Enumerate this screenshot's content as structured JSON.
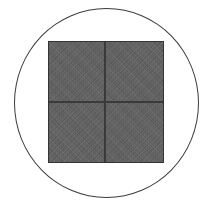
{
  "figure": {
    "background_color": "#ffffff",
    "width": 215,
    "height": 224,
    "circle": {
      "name": "circle-outline",
      "stroke_color": "#3c3c3c",
      "fill": "none"
    },
    "square": {
      "name": "textured-quad-square",
      "fill_color": "#626262",
      "border_color": "#343434",
      "divider_color": "#3a3a3a",
      "texture": "diagonal-weave",
      "quadrant_count": 4,
      "quadrants": [
        {
          "position": "top-left",
          "fill_color": "#626262"
        },
        {
          "position": "top-right",
          "fill_color": "#626262"
        },
        {
          "position": "bottom-left",
          "fill_color": "#626262"
        },
        {
          "position": "bottom-right",
          "fill_color": "#626262"
        }
      ]
    },
    "caption": {
      "text": "",
      "visible": "clipped",
      "color": "#b9b9b9"
    }
  }
}
